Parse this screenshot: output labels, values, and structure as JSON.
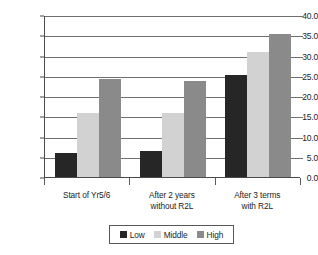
{
  "chart_data": {
    "type": "bar",
    "title": "",
    "subtitle": "",
    "xlabel": "",
    "ylabel": "",
    "ylim": [
      0.0,
      40.0
    ],
    "ytick_step": 5.0,
    "ytick_labels": [
      "40.0",
      "35.0",
      "30.0",
      "25.0",
      "20.0",
      "15.0",
      "10.0",
      "5.0",
      "0.0"
    ],
    "ytick_values": [
      40.0,
      35.0,
      30.0,
      25.0,
      20.0,
      15.0,
      10.0,
      5.0,
      0.0
    ],
    "grid": true,
    "grid_axis": "y",
    "legend_position": "bottom",
    "categories": [
      "Start of Yr5/6",
      "After 2 years without R2L",
      "After 3 terms with R2L"
    ],
    "category_lines": [
      [
        "Start of Yr5/6"
      ],
      [
        "After 2 years",
        "without R2L"
      ],
      [
        "After 3 terms",
        "with R2L"
      ]
    ],
    "series": [
      {
        "name": "Low",
        "color": "#262626",
        "values": [
          6.0,
          6.4,
          25.3
        ]
      },
      {
        "name": "Middle",
        "color": "#d2d2d2",
        "values": [
          15.7,
          15.8,
          30.8
        ]
      },
      {
        "name": "High",
        "color": "#8a8a8a",
        "values": [
          24.3,
          23.6,
          35.4
        ]
      }
    ]
  },
  "legend": {
    "items": [
      {
        "label": "Low",
        "color": "#262626"
      },
      {
        "label": "Middle",
        "color": "#d2d2d2"
      },
      {
        "label": "High",
        "color": "#8a8a8a"
      }
    ]
  },
  "axis": {
    "y_labels": [
      "40.0",
      "35.0",
      "30.0",
      "25.0",
      "20.0",
      "15.0",
      "10.0",
      "5.0",
      "0.0"
    ]
  }
}
